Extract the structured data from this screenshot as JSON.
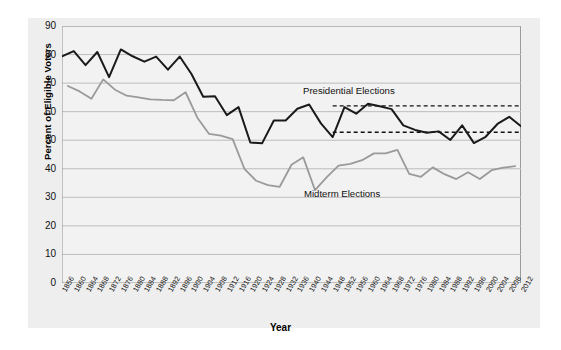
{
  "chart_data": {
    "type": "line",
    "title": "",
    "xlabel": "Year",
    "ylabel": "Percent of Eligible Voters",
    "ylim": [
      0,
      90
    ],
    "ytick_step": 10,
    "yticks": [
      0,
      10,
      20,
      30,
      40,
      50,
      60,
      70,
      80,
      90
    ],
    "xlim": [
      1856,
      2012
    ],
    "xticks": [
      1856,
      1860,
      1864,
      1868,
      1872,
      1876,
      1880,
      1884,
      1888,
      1892,
      1896,
      1900,
      1904,
      1908,
      1912,
      1916,
      1920,
      1924,
      1928,
      1932,
      1936,
      1940,
      1944,
      1948,
      1952,
      1956,
      1960,
      1964,
      1968,
      1972,
      1976,
      1980,
      1984,
      1988,
      1992,
      1996,
      2000,
      2004,
      2008,
      2012
    ],
    "grid": true,
    "grid_axis": "y",
    "legend_position": "inline-annotation",
    "background": "#f2f2f2",
    "series": [
      {
        "name": "Presidential Elections",
        "color": "#1a1a1a",
        "x": [
          1856,
          1860,
          1864,
          1868,
          1872,
          1876,
          1880,
          1884,
          1888,
          1892,
          1896,
          1900,
          1904,
          1908,
          1912,
          1916,
          1920,
          1924,
          1928,
          1932,
          1936,
          1940,
          1944,
          1948,
          1952,
          1956,
          1960,
          1964,
          1968,
          1972,
          1976,
          1980,
          1984,
          1988,
          1992,
          1996,
          2000,
          2004,
          2008,
          2012
        ],
        "values": [
          79.4,
          81.2,
          76.3,
          80.9,
          72.1,
          81.8,
          79.4,
          77.5,
          79.3,
          74.7,
          79.3,
          73.2,
          65.2,
          65.4,
          58.8,
          61.6,
          49.2,
          48.9,
          56.9,
          56.9,
          61.0,
          62.5,
          55.9,
          51.1,
          61.6,
          59.3,
          62.8,
          61.9,
          60.9,
          55.2,
          53.6,
          52.6,
          53.1,
          50.1,
          55.2,
          49.0,
          51.2,
          55.7,
          58.2,
          54.9
        ]
      },
      {
        "name": "Midterm Elections",
        "color": "#9a9a9a",
        "x": [
          1858,
          1862,
          1866,
          1870,
          1874,
          1878,
          1882,
          1886,
          1890,
          1894,
          1898,
          1902,
          1906,
          1910,
          1914,
          1918,
          1922,
          1926,
          1930,
          1934,
          1938,
          1942,
          1946,
          1950,
          1954,
          1958,
          1962,
          1966,
          1970,
          1974,
          1978,
          1982,
          1986,
          1990,
          1994,
          1998,
          2002,
          2006,
          2010
        ],
        "values": [
          69.0,
          67.1,
          64.5,
          71.3,
          67.7,
          65.6,
          65.0,
          64.3,
          64.1,
          64.0,
          66.8,
          57.9,
          52.2,
          51.6,
          50.4,
          40.0,
          35.8,
          34.3,
          33.7,
          41.4,
          44.0,
          32.5,
          37.1,
          41.1,
          41.7,
          43.0,
          45.4,
          45.4,
          46.6,
          38.2,
          37.2,
          40.5,
          38.1,
          36.4,
          38.8,
          36.4,
          39.5,
          40.4,
          40.9
        ]
      }
    ],
    "reference_lines": [
      {
        "name": "upper-dashed",
        "value": 62.0,
        "x_start": 1948,
        "x_end": 2012,
        "style": "dashed",
        "color": "#111111"
      },
      {
        "name": "lower-dashed",
        "value": 52.8,
        "x_start": 1948,
        "x_end": 2012,
        "style": "dashed",
        "color": "#111111"
      }
    ],
    "annotations": [
      {
        "name": "presidential-label",
        "text": "Presidential Elections"
      },
      {
        "name": "midterm-label",
        "text": "Midterm Elections"
      }
    ]
  },
  "axis": {
    "y_title": "Percent of Eligible Voters",
    "x_title": "Year"
  }
}
